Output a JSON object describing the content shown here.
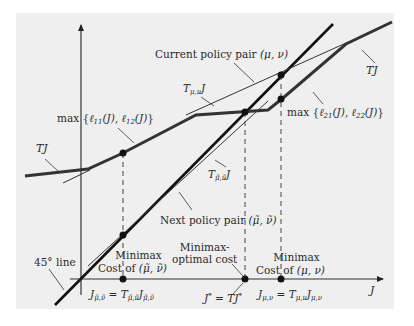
{
  "diagram": {
    "type": "minimax policy iteration illustration",
    "background_color": "#efefef",
    "line_color": "#222222",
    "axes": {
      "x_label": "J",
      "y_axis": "vertical arrow"
    },
    "labels": {
      "current_policy_pair": "Current policy pair (μ, ν)",
      "next_policy_pair": "Next policy pair (μ̃, ν̃)",
      "max_l11_l12": "max {ℓ11(J), ℓ12(J)}",
      "max_l21_l22": "max {ℓ21(J), ℓ22(J)}",
      "tj_left": "TJ",
      "tj_right": "TJ",
      "t_mu_nu_j": "Tμ,νJ",
      "t_mutilde_nutilde_j": "Tμ̃,ν̃J",
      "line_45": "45° line",
      "minimax_cost_tilde_line1": "Minimax",
      "minimax_cost_tilde_line2": "Cost of (μ̃, ν̃)",
      "minimax_optimal_line1": "Minimax-",
      "minimax_optimal_line2": "optimal cost",
      "minimax_cost_line1": "Minimax",
      "minimax_cost_line2": "Cost of (μ, ν)",
      "j_tilde_eq": "Jμ̃,ν̃ = Tμ̃,ν̃Jμ̃,ν̃",
      "j_star_eq": "J* = TJ*",
      "j_mu_nu_eq": "Jμ,ν = Tμ,νJμ,ν",
      "x_axis_label": "J"
    },
    "text_parts": {
      "max": "max",
      "l11": "ℓ",
      "l11_sub": "11",
      "l12_sub": "12",
      "l21_sub": "21",
      "l22_sub": "22",
      "of_J": "(J)",
      "lbrace": "{",
      "rbrace": "}",
      "comma": ",",
      "T": "T",
      "J": "J",
      "sub_mu_nu": "μ,ν",
      "sub_tilde": "μ̃,ν̃",
      "eq": "=",
      "star": "*",
      "current_text": "Current policy pair ",
      "current_math": "(μ, ν)",
      "next_text": "Next policy pair ",
      "next_math": "(μ̃, ν̃)",
      "line45": "45° line",
      "minimax": "Minimax",
      "minimax_dash": "Minimax-",
      "optimal_cost": "optimal cost",
      "cost_of": "Cost of ",
      "pair_tilde": "(μ̃, ν̃)",
      "pair": "(μ, ν)"
    }
  }
}
